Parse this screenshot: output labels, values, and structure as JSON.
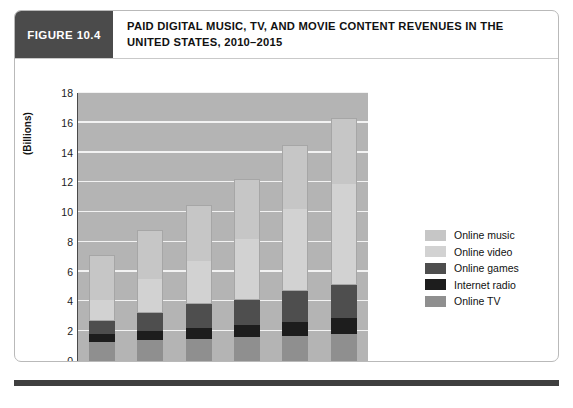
{
  "figure": {
    "tag": "FIGURE 10.4",
    "title": "PAID DIGITAL MUSIC, TV, AND MOVIE CONTENT REVENUES IN THE UNITED STATES, 2010–2015"
  },
  "colors": {
    "tag_background": "#4b4b4b",
    "plot_background": "#b4b4b4",
    "gridline": "#f2f2f2",
    "axis": "#4a4a4a",
    "online_music": "#c6c6c6",
    "online_video": "#d2d2d2",
    "online_games": "#4e4e4e",
    "internet_radio": "#1d1d1d",
    "online_tv": "#8f8f8f",
    "footer_rule": "#3f3f3f"
  },
  "chart_data": {
    "type": "bar",
    "subtype": "stacked-column",
    "title": "PAID DIGITAL MUSIC, TV, AND MOVIE CONTENT REVENUES IN THE UNITED STATES, 2010–2015",
    "xlabel": "",
    "ylabel": "(Billions)",
    "ylim": [
      0,
      18
    ],
    "ytick_step": 2,
    "yticks": [
      0,
      2,
      4,
      6,
      8,
      10,
      12,
      14,
      16,
      18
    ],
    "ytick_labels": [
      "0",
      "2",
      "4",
      "6",
      "8",
      "10",
      "12",
      "14",
      "16",
      "18"
    ],
    "categories": [
      "2010",
      "2011",
      "2012",
      "2013",
      "2014",
      "2015"
    ],
    "grid": true,
    "legend_position": "right",
    "stack_order_bottom_to_top": [
      "Online TV",
      "Internet radio",
      "Online games",
      "Online video",
      "Online music"
    ],
    "series": [
      {
        "name": "Online TV",
        "color": "#8f8f8f",
        "values": [
          1.3,
          1.4,
          1.5,
          1.6,
          1.7,
          1.8
        ]
      },
      {
        "name": "Internet radio",
        "color": "#1d1d1d",
        "values": [
          0.5,
          0.6,
          0.7,
          0.8,
          0.9,
          1.1
        ]
      },
      {
        "name": "Online games",
        "color": "#4e4e4e",
        "values": [
          0.9,
          1.2,
          1.6,
          1.7,
          2.1,
          2.2
        ]
      },
      {
        "name": "Online video",
        "color": "#d2d2d2",
        "values": [
          1.4,
          2.3,
          2.9,
          4.1,
          5.5,
          6.8
        ]
      },
      {
        "name": "Online music",
        "color": "#c6c6c6",
        "values": [
          3.0,
          3.3,
          3.8,
          4.0,
          4.3,
          4.4
        ]
      }
    ],
    "totals": [
      7.1,
      8.8,
      10.5,
      12.2,
      14.5,
      16.3
    ]
  },
  "legend": {
    "items": [
      {
        "label": "Online music",
        "color": "#c6c6c6"
      },
      {
        "label": "Online video",
        "color": "#d2d2d2"
      },
      {
        "label": "Online games",
        "color": "#4e4e4e"
      },
      {
        "label": "Internet radio",
        "color": "#1d1d1d"
      },
      {
        "label": "Online TV",
        "color": "#8f8f8f"
      }
    ]
  }
}
